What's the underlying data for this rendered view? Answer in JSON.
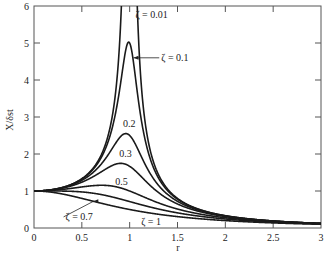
{
  "chart_data": {
    "type": "line",
    "title": "",
    "xlabel": "r",
    "ylabel": "X/δst",
    "xlim": [
      0,
      3
    ],
    "ylim": [
      0,
      6
    ],
    "grid": false,
    "legend": "none (inline annotations)",
    "x_ticks": [
      "0",
      "0.5",
      "1",
      "1.5",
      "2",
      "2.5",
      "3"
    ],
    "y_ticks": [
      "0",
      "1",
      "2",
      "3",
      "4",
      "5",
      "6"
    ],
    "formula": "X/δst = 1 / sqrt((1 - r^2)^2 + (2ζr)^2)",
    "series": [
      {
        "name": "ζ = 0.01",
        "zeta": 0.01,
        "peak": "> 6 (clipped at r≈1)"
      },
      {
        "name": "ζ = 0.1",
        "zeta": 0.1,
        "peak": 5.0
      },
      {
        "name": "0.2",
        "zeta": 0.2,
        "peak": 2.5
      },
      {
        "name": "0.3",
        "zeta": 0.3,
        "peak": 1.75
      },
      {
        "name": "0.5",
        "zeta": 0.5,
        "peak": 1.15
      },
      {
        "name": "ζ = 0.7",
        "zeta": 0.7,
        "peak": 1.0
      },
      {
        "name": "ζ = 1",
        "zeta": 1.0,
        "peak": 1.0
      }
    ],
    "annotations": [
      {
        "text": "ζ = 0.01",
        "x": 1.06,
        "y": 5.75
      },
      {
        "text": "ζ = 0.1",
        "x": 1.33,
        "y": 4.6,
        "arrow_to": [
          1.04,
          4.6
        ]
      },
      {
        "text": "0.2",
        "x": 0.93,
        "y": 2.8
      },
      {
        "text": "0.3",
        "x": 0.89,
        "y": 2.0
      },
      {
        "text": "0.5",
        "x": 0.85,
        "y": 1.25
      },
      {
        "text": "ζ = 0.7",
        "x": 0.33,
        "y": 0.3,
        "arrow_to": [
          0.62,
          0.72
        ]
      },
      {
        "text": "ζ = 1",
        "x": 1.12,
        "y": 0.15
      }
    ]
  }
}
